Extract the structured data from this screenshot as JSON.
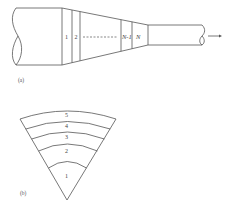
{
  "figure_a": {
    "caption": "(a)",
    "section_labels": [
      "1",
      "2",
      "N-1",
      "N"
    ],
    "description": "Tapered pipe (nozzle) divided into N cross-sectional segments, flow exits to the right",
    "flow_arrow_icon": "arrow-right-icon"
  },
  "figure_b": {
    "caption": "(b)",
    "ring_labels": [
      "1",
      "2",
      "3",
      "4",
      "5"
    ],
    "description": "Fan-shaped sector divided into 5 concentric annular bands"
  },
  "colors": {
    "line": "#555555",
    "text": "#444444",
    "background": "#ffffff"
  }
}
